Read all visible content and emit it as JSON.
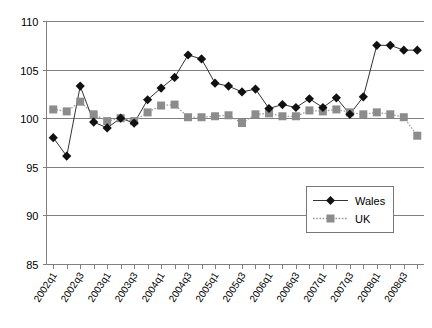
{
  "chart_data": {
    "type": "line",
    "title": "",
    "xlabel": "",
    "ylabel": "",
    "ylim": [
      85,
      110
    ],
    "ytick_labels": [
      "110",
      "105",
      "100",
      "95",
      "90",
      "85"
    ],
    "ytick_values": [
      110,
      105,
      100,
      95,
      90,
      85
    ],
    "grid": true,
    "legend_position": "inside-bottom-right",
    "x": [
      "2002q1",
      "2002q2",
      "2002q3",
      "2002q4",
      "2003q1",
      "2003q2",
      "2003q3",
      "2003q4",
      "2004q1",
      "2004q2",
      "2004q3",
      "2004q4",
      "2005q1",
      "2005q2",
      "2005q3",
      "2005q4",
      "2006q1",
      "2006q2",
      "2006q3",
      "2006q4",
      "2007q1",
      "2007q2",
      "2007q3",
      "2007q4",
      "2008q1",
      "2008q2",
      "2008q3",
      "2008q4"
    ],
    "xtick_labels_shown": [
      "2002q1",
      "2002q3",
      "2003q1",
      "2003q3",
      "2004q1",
      "2004q3",
      "2005q1",
      "2005q3",
      "2006q1",
      "2006q3",
      "2007q1",
      "2007q3",
      "2008q1",
      "2008q3"
    ],
    "series": [
      {
        "name": "Wales",
        "color": "#111111",
        "marker": "diamond",
        "linestyle": "solid",
        "values": [
          98.0,
          96.1,
          103.3,
          99.6,
          99.0,
          100.0,
          99.5,
          101.9,
          103.1,
          104.2,
          106.5,
          106.1,
          103.6,
          103.3,
          102.7,
          103.0,
          101.0,
          101.4,
          101.1,
          102.0,
          101.1,
          102.1,
          100.4,
          102.2,
          107.5,
          107.5,
          107.0,
          107.0
        ]
      },
      {
        "name": "UK",
        "color": "#8c8c8c",
        "marker": "square",
        "linestyle": "dotted",
        "values": [
          100.9,
          100.7,
          101.7,
          100.4,
          99.7,
          100.0,
          99.7,
          100.6,
          101.3,
          101.4,
          100.1,
          100.1,
          100.2,
          100.3,
          99.5,
          100.4,
          100.5,
          100.2,
          100.2,
          100.8,
          100.7,
          100.9,
          100.6,
          100.4,
          100.6,
          100.4,
          100.1,
          98.2
        ]
      }
    ]
  },
  "legend": {
    "entries": [
      {
        "label": "Wales"
      },
      {
        "label": "UK"
      }
    ]
  }
}
